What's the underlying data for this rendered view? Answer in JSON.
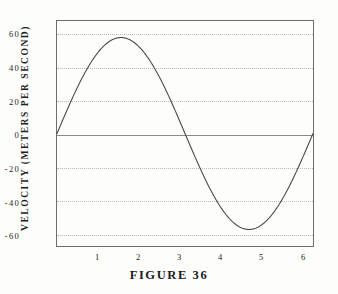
{
  "caption": "FIGURE 36",
  "axis": {
    "y_title": "VELOCITY (METERS PER SECOND)",
    "x_title": ""
  },
  "chart_data": {
    "type": "line",
    "title": "FIGURE 36",
    "xlabel": "",
    "ylabel": "VELOCITY (METERS PER SECOND)",
    "xlim": [
      0,
      6.2832
    ],
    "ylim": [
      -68,
      68
    ],
    "grid": true,
    "legend": null,
    "x_ticks": [
      1,
      2,
      3,
      4,
      5,
      6
    ],
    "x_tick_labels": [
      "1",
      "2",
      "3",
      "4",
      "5",
      "6"
    ],
    "y_ticks": [
      60,
      40,
      20,
      0,
      -20,
      -40,
      -60
    ],
    "y_tick_labels": [
      "60",
      "40",
      "20",
      "0",
      "-20",
      "-40",
      "-60"
    ],
    "zero_line": 0,
    "series": [
      {
        "name": "velocity",
        "description": "v = 58 sin(x), one full sine cycle from x = 0 to x = 2 pi",
        "amplitude": 58,
        "period": 6.2832,
        "x": [
          0.0,
          0.2,
          0.4,
          0.6,
          0.8,
          1.0,
          1.2,
          1.4,
          1.5708,
          1.8,
          2.0,
          2.2,
          2.4,
          2.6,
          2.8,
          3.0,
          3.1416,
          3.4,
          3.6,
          3.8,
          4.0,
          4.2,
          4.4,
          4.6,
          4.7124,
          5.0,
          5.2,
          5.4,
          5.6,
          5.8,
          6.0,
          6.2,
          6.2832
        ],
        "y": [
          0.0,
          11.5,
          22.6,
          32.7,
          41.6,
          48.8,
          54.1,
          57.2,
          58.0,
          56.5,
          52.7,
          46.9,
          39.2,
          29.9,
          19.5,
          8.2,
          0.0,
          -15.2,
          -25.7,
          -35.5,
          -43.9,
          -50.6,
          -55.4,
          -57.8,
          -58.0,
          -55.6,
          -50.4,
          -44.3,
          -36.9,
          -27.6,
          -16.2,
          -3.9,
          0.0
        ]
      }
    ]
  }
}
